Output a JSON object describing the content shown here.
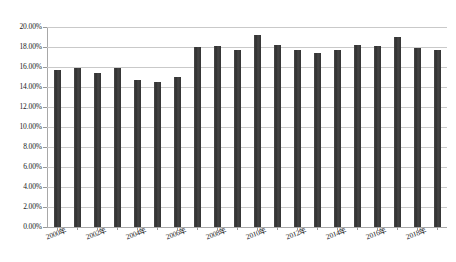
{
  "chart_data": {
    "type": "bar",
    "title": "",
    "subtitle": "",
    "xlabel": "",
    "ylabel": "",
    "categories": [
      "2000年",
      "2001年",
      "2002年",
      "2003年",
      "2004年",
      "2005年",
      "2006年",
      "2007年",
      "2008年",
      "2009年",
      "2010年",
      "2011年",
      "2012年",
      "2013年",
      "2014年",
      "2015年",
      "2016年",
      "2017年",
      "2018年",
      "2019年"
    ],
    "values": [
      15.7,
      15.9,
      15.4,
      15.9,
      14.7,
      14.5,
      15.0,
      18.0,
      18.1,
      17.75,
      19.2,
      18.25,
      17.75,
      17.4,
      17.75,
      18.25,
      18.15,
      19.05,
      17.95,
      17.75
    ],
    "value_format": "percent",
    "ylim": [
      0,
      20
    ],
    "ytick_values": [
      0,
      2,
      4,
      6,
      8,
      10,
      12,
      14,
      16,
      18,
      20
    ],
    "ytick_labels": [
      "0.00%",
      "2.00%",
      "4.00%",
      "6.00%",
      "8.00%",
      "10.00%",
      "12.00%",
      "14.00%",
      "16.00%",
      "18.00%",
      "20.00%"
    ],
    "xtick_labels_visible": [
      "2000年",
      "2002年",
      "2004年",
      "2006年",
      "2008年",
      "2010年",
      "2012年",
      "2014年",
      "2016年",
      "2018年"
    ],
    "xtick_label_interval": 2,
    "xtick_label_rotation": -20,
    "grid": {
      "horizontal": true,
      "vertical": false,
      "color": "#c9c9c9"
    },
    "legend": {
      "visible": false,
      "position": "none",
      "entries": []
    },
    "series": [
      {
        "name": "",
        "color": "#3b3b3b",
        "values": [
          15.7,
          15.9,
          15.4,
          15.9,
          14.7,
          14.5,
          15.0,
          18.0,
          18.1,
          17.75,
          19.2,
          18.25,
          17.75,
          17.4,
          17.75,
          18.25,
          18.15,
          19.05,
          17.95,
          17.75
        ]
      }
    ],
    "annotations": [],
    "colors": {
      "bar": "#3b3b3b",
      "gridline": "#c9c9c9",
      "axis": "#a8a8a8",
      "text": "#1a1a1a",
      "background": "#ffffff"
    }
  }
}
